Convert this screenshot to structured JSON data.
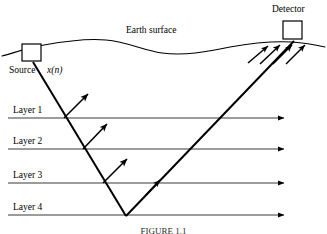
{
  "figure": {
    "width": 327,
    "height": 234,
    "background_color": "#ffffff",
    "ink_color": "#000000",
    "layer_line_color": "#3a3a3a"
  },
  "labels": {
    "earth_surface": "Earth surface",
    "detector": "Detector",
    "source": "Source",
    "source_signal": "x(n)",
    "layers": [
      {
        "name": "Layer 1",
        "line_y": 118
      },
      {
        "name": "Layer 2",
        "line_y": 149
      },
      {
        "name": "Layer 3",
        "line_y": 183
      },
      {
        "name": "Layer 4",
        "line_y": 215
      }
    ]
  },
  "caption": {
    "text": "FIGURE 1.1"
  },
  "elements": {
    "source_box": {
      "x": 22,
      "y": 44,
      "w": 19,
      "h": 17
    },
    "detector_box": {
      "x": 283,
      "y": 21,
      "w": 19,
      "h": 18
    },
    "layer_line_start_x": 8,
    "layer_line_end_x": 288,
    "ray_vertex": {
      "x": 126,
      "y": 215
    },
    "reflection_arrow_count": 3,
    "detector_arrow_count": 4
  }
}
